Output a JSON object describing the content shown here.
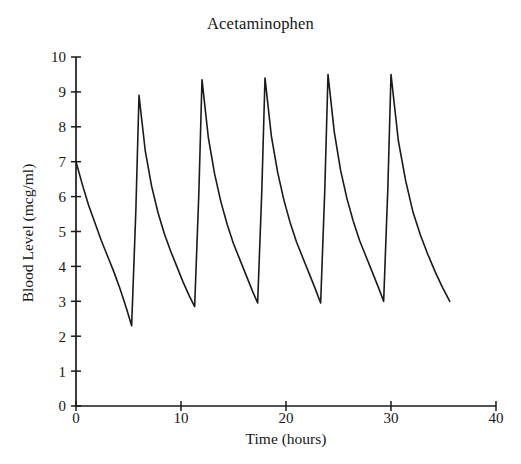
{
  "chart_data": {
    "type": "line",
    "title": "Acetaminophen",
    "xlabel": "Time (hours)",
    "ylabel": "Blood Level (mcg/ml)",
    "xlim": [
      0,
      40
    ],
    "ylim": [
      0,
      10
    ],
    "xticks": [
      0,
      10,
      20,
      30,
      40
    ],
    "xtick_labels": [
      "0",
      "10",
      "20",
      "30",
      "40"
    ],
    "yticks": [
      0,
      1,
      2,
      3,
      4,
      5,
      6,
      7,
      8,
      9,
      10
    ],
    "ytick_labels": [
      "0",
      "1",
      "2",
      "3",
      "4",
      "5",
      "6",
      "7",
      "8",
      "9",
      "10"
    ],
    "grid": false,
    "legend": false,
    "line_color": "#1a1a1a",
    "line_width": 1.6,
    "series": [
      {
        "name": "Blood Level",
        "x": [
          0.0,
          0.6,
          1.2,
          1.8,
          2.4,
          3.0,
          3.6,
          4.2,
          4.8,
          5.3,
          5.3,
          5.7,
          6.0,
          6.0,
          6.6,
          7.2,
          7.8,
          8.4,
          9.0,
          9.6,
          10.2,
          10.8,
          11.3,
          11.3,
          11.7,
          12.0,
          12.0,
          12.6,
          13.2,
          13.8,
          14.4,
          15.0,
          15.6,
          16.2,
          16.8,
          17.3,
          17.3,
          17.7,
          18.0,
          18.0,
          18.6,
          19.2,
          19.8,
          20.4,
          21.0,
          21.6,
          22.2,
          22.8,
          23.3,
          23.3,
          23.7,
          24.0,
          24.0,
          24.6,
          25.2,
          25.8,
          26.4,
          27.0,
          27.6,
          28.2,
          28.8,
          29.3,
          29.3,
          29.7,
          30.0,
          30.0,
          30.7,
          31.4,
          32.1,
          32.8,
          33.5,
          34.2,
          34.9,
          35.6
        ],
        "y": [
          7.0,
          6.35,
          5.75,
          5.25,
          4.75,
          4.3,
          3.85,
          3.35,
          2.8,
          2.3,
          2.3,
          5.6,
          8.9,
          8.9,
          7.3,
          6.3,
          5.55,
          4.95,
          4.45,
          4.0,
          3.55,
          3.15,
          2.85,
          2.85,
          6.1,
          9.35,
          9.35,
          7.7,
          6.65,
          5.85,
          5.2,
          4.65,
          4.2,
          3.75,
          3.3,
          2.95,
          2.95,
          6.2,
          9.4,
          9.4,
          7.75,
          6.7,
          5.9,
          5.25,
          4.7,
          4.25,
          3.8,
          3.35,
          2.95,
          2.95,
          6.25,
          9.5,
          9.5,
          7.85,
          6.75,
          5.95,
          5.3,
          4.75,
          4.3,
          3.85,
          3.4,
          3.0,
          3.0,
          6.25,
          9.5,
          9.5,
          7.6,
          6.45,
          5.55,
          4.9,
          4.35,
          3.85,
          3.4,
          3.0
        ]
      }
    ],
    "peaks": [
      {
        "time": 6.0,
        "value": 8.9
      },
      {
        "time": 12.0,
        "value": 9.35
      },
      {
        "time": 18.0,
        "value": 9.4
      },
      {
        "time": 24.0,
        "value": 9.5
      },
      {
        "time": 30.0,
        "value": 9.5
      }
    ],
    "troughs": [
      {
        "time": 5.3,
        "value": 2.3
      },
      {
        "time": 11.3,
        "value": 2.85
      },
      {
        "time": 17.3,
        "value": 2.95
      },
      {
        "time": 23.3,
        "value": 2.95
      },
      {
        "time": 29.3,
        "value": 3.0
      },
      {
        "time": 35.6,
        "value": 3.0
      }
    ],
    "start_point": {
      "time": 0,
      "value": 7.0
    }
  }
}
